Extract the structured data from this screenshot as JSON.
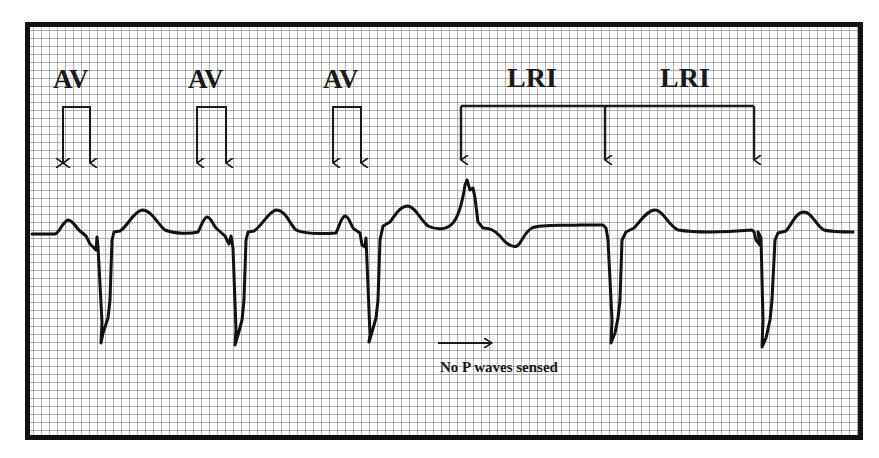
{
  "figure": {
    "title": "",
    "annotations": {
      "av_labels": [
        {
          "text": "AV",
          "x": 53,
          "y": 66
        },
        {
          "text": "AV",
          "x": 188,
          "y": 66
        },
        {
          "text": "AV",
          "x": 323,
          "y": 66
        }
      ],
      "lri_labels": [
        {
          "text": "LRI",
          "x": 507,
          "y": 64
        },
        {
          "text": "LRI",
          "x": 660,
          "y": 64
        }
      ],
      "note": {
        "text": "No P waves sensed",
        "x": 440,
        "y": 360
      }
    },
    "av_brackets": [
      {
        "x1": 63,
        "x2": 90,
        "top": 107,
        "bottom": 163
      },
      {
        "x1": 197,
        "x2": 226,
        "top": 107,
        "bottom": 163
      },
      {
        "x1": 333,
        "x2": 361,
        "top": 107,
        "bottom": 163
      }
    ],
    "lri_bracket": {
      "x1": 461,
      "xmid": 605,
      "x2": 754,
      "top": 106,
      "bottom": 160
    },
    "note_arrow": {
      "x1": 438,
      "x2": 492,
      "y": 343
    },
    "colors": {
      "trace": "#111111",
      "grid": "#8a8a8a",
      "border": "#111111",
      "background": "#ffffff"
    }
  }
}
